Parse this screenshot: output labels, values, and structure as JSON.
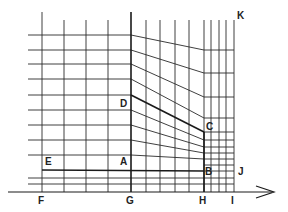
{
  "diagram": {
    "type": "grid-transition-schematic",
    "labels": {
      "A": "A",
      "B": "B",
      "C": "C",
      "D": "D",
      "E": "E",
      "F": "F",
      "G": "G",
      "H": "H",
      "I": "I",
      "J": "J",
      "K": "K"
    },
    "colors": {
      "line": "#2a2a2a",
      "background": "#ffffff"
    },
    "geometry": {
      "left_x_start": 28,
      "x_F": 42,
      "x_G": 131,
      "x_H": 204,
      "x_I": 234,
      "axis_y": 192,
      "left_verticals_x": [
        42,
        64,
        86,
        108,
        131
      ],
      "middle_verticals_x": [
        146,
        160,
        175,
        189
      ],
      "right_verticals_x": [
        204,
        211,
        219,
        226,
        234
      ],
      "left_horizontals_y": [
        35,
        50,
        64,
        79,
        95,
        110,
        125,
        140,
        155,
        170
      ],
      "right_horizontals_y": [
        50,
        73,
        97,
        118,
        132,
        140,
        147,
        153,
        159,
        165,
        171
      ],
      "bottom_horizontals_y": [
        178,
        184
      ],
      "heavy_lines": [
        {
          "name": "D-C",
          "from": [
            131,
            95
          ],
          "to": [
            204,
            132
          ]
        },
        {
          "name": "E-A-B",
          "from": [
            42,
            170
          ],
          "to": [
            204,
            171
          ]
        },
        {
          "name": "G-vertical",
          "from": [
            131,
            12
          ],
          "to": [
            131,
            192
          ]
        },
        {
          "name": "F-vertical",
          "from": [
            42,
            12
          ],
          "to": [
            42,
            192
          ]
        },
        {
          "name": "H-C-B",
          "from": [
            204,
            132
          ],
          "to": [
            204,
            192
          ]
        }
      ]
    }
  }
}
